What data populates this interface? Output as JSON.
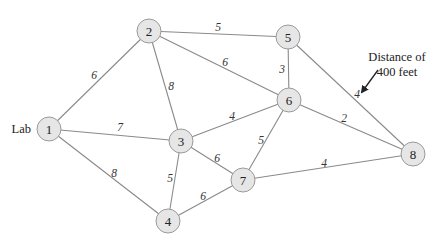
{
  "diagram": {
    "nodes": [
      {
        "id": "1",
        "label": "1",
        "x": 49,
        "y": 129
      },
      {
        "id": "2",
        "label": "2",
        "x": 149,
        "y": 31
      },
      {
        "id": "3",
        "label": "3",
        "x": 181,
        "y": 141
      },
      {
        "id": "4",
        "label": "4",
        "x": 168,
        "y": 221
      },
      {
        "id": "5",
        "label": "5",
        "x": 288,
        "y": 37
      },
      {
        "id": "6",
        "label": "6",
        "x": 289,
        "y": 100
      },
      {
        "id": "7",
        "label": "7",
        "x": 243,
        "y": 180
      },
      {
        "id": "8",
        "label": "8",
        "x": 413,
        "y": 154
      }
    ],
    "edges": [
      {
        "from": "1",
        "to": "2",
        "weight": "6",
        "lx": 94,
        "ly": 75
      },
      {
        "from": "1",
        "to": "3",
        "weight": "7",
        "lx": 120,
        "ly": 127
      },
      {
        "from": "1",
        "to": "4",
        "weight": "8",
        "lx": 114,
        "ly": 173
      },
      {
        "from": "2",
        "to": "3",
        "weight": "8",
        "lx": 171,
        "ly": 86
      },
      {
        "from": "2",
        "to": "5",
        "weight": "5",
        "lx": 218,
        "ly": 27
      },
      {
        "from": "2",
        "to": "6",
        "weight": "6",
        "lx": 225,
        "ly": 62
      },
      {
        "from": "3",
        "to": "6",
        "weight": "4",
        "lx": 232,
        "ly": 116
      },
      {
        "from": "3",
        "to": "7",
        "weight": "6",
        "lx": 217,
        "ly": 158
      },
      {
        "from": "3",
        "to": "4",
        "weight": "5",
        "lx": 170,
        "ly": 178
      },
      {
        "from": "4",
        "to": "7",
        "weight": "6",
        "lx": 203,
        "ly": 196
      },
      {
        "from": "5",
        "to": "6",
        "weight": "3",
        "lx": 282,
        "ly": 69
      },
      {
        "from": "5",
        "to": "8",
        "weight": "4",
        "lx": 357,
        "ly": 94
      },
      {
        "from": "6",
        "to": "7",
        "weight": "5",
        "lx": 261,
        "ly": 140
      },
      {
        "from": "6",
        "to": "8",
        "weight": "2",
        "lx": 344,
        "ly": 118
      },
      {
        "from": "7",
        "to": "8",
        "weight": "4",
        "lx": 324,
        "ly": 163
      }
    ],
    "node_radius": 12,
    "start_label": {
      "text": "Lab",
      "for_node": "1"
    },
    "annotation": {
      "line1": "Distance of",
      "line2": "400 feet",
      "arrow_from": [
        378,
        70
      ],
      "arrow_to": [
        362,
        92
      ]
    },
    "colors": {
      "node_fill": "#e6e6e6",
      "node_stroke": "#9a9a9a",
      "edge": "#8a8a8a",
      "text": "#222222"
    }
  }
}
